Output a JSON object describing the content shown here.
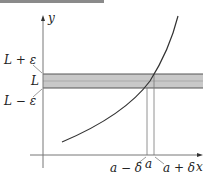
{
  "diagram": {
    "axes": {
      "x_label": "x",
      "y_label": "y"
    },
    "y_labels": {
      "upper": "L + ε",
      "center": "L",
      "lower": "L − ε"
    },
    "x_labels": {
      "left": "a − δ",
      "center": "a",
      "right": "a + δ"
    },
    "colors": {
      "band": "#c8c8c8",
      "band_edge": "#555555",
      "curve": "#333333",
      "axis": "#777777"
    }
  }
}
